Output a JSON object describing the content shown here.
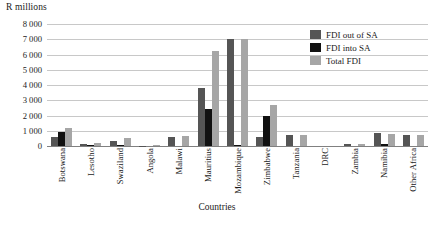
{
  "chart_data": {
    "type": "bar",
    "title": "",
    "xlabel": "Countries",
    "ylabel": "R millions",
    "ylim": [
      0,
      8000
    ],
    "ytick_labels": [
      "8 000",
      "7 000",
      "6 000",
      "5 000",
      "4 000",
      "3 000",
      "2 000",
      "1 000",
      "0"
    ],
    "ytick_values": [
      8000,
      7000,
      6000,
      5000,
      4000,
      3000,
      2000,
      1000,
      0
    ],
    "grid": true,
    "legend_position": "top-right",
    "categories": [
      "Botswana",
      "Lesotho",
      "Swaziland",
      "Angola",
      "Malawi",
      "Mauritius",
      "Mozambique",
      "Zimbabwe",
      "Tanzania",
      "DRC",
      "Zambia",
      "Namibia",
      "Other Africa"
    ],
    "series": [
      {
        "name": "FDI out of SA",
        "color": "#555555",
        "values": [
          600,
          150,
          350,
          30,
          600,
          3800,
          7000,
          600,
          700,
          0,
          100,
          850,
          700
        ]
      },
      {
        "name": "FDI into SA",
        "color": "#111111",
        "values": [
          900,
          60,
          50,
          0,
          0,
          2400,
          40,
          2000,
          0,
          0,
          0,
          150,
          0
        ]
      },
      {
        "name": "Total FDI",
        "color": "#a6a6a6",
        "values": [
          1200,
          200,
          500,
          40,
          650,
          6200,
          7000,
          2700,
          700,
          0,
          120,
          800,
          700
        ]
      }
    ]
  }
}
